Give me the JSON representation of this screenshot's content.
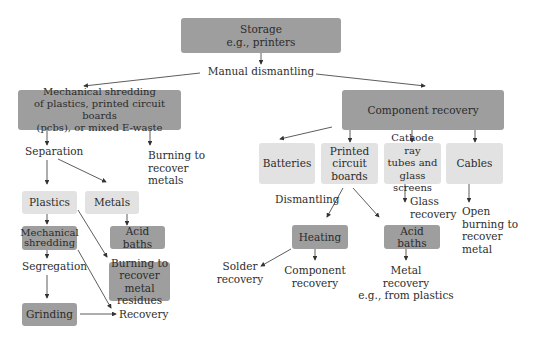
{
  "diagram": {
    "storage": {
      "line1": "Storage",
      "line2": "e.g., printers"
    },
    "manual_dismantling": "Manual dismantling",
    "mech_shredding_main": {
      "line1": "Mechanical shredding",
      "line2": "of plastics, printed circuit boards",
      "line3": "(pcbs), or mixed E-waste"
    },
    "separation": "Separation",
    "burning_recover_metals": {
      "line1": "Burning to",
      "line2": "recover",
      "line3": "metals"
    },
    "plastics": "Plastics",
    "metals": "Metals",
    "mech_shredding_sub": {
      "line1": "Mechanical",
      "line2": "shredding"
    },
    "acid_baths_left": "Acid baths",
    "segregation": "Segregation",
    "burning_residues": {
      "line1": "Burning to",
      "line2": "recover metal",
      "line3": "residues"
    },
    "grinding": "Grinding",
    "recovery": "Recovery",
    "component_recovery": "Component recovery",
    "batteries": "Batteries",
    "pcb": {
      "line1": "Printed",
      "line2": "circuit",
      "line3": "boards"
    },
    "crt": {
      "line1": "Cathode ray",
      "line2": "tubes and",
      "line3": "glass screens"
    },
    "cables": "Cables",
    "dismantling": "Dismantling",
    "glass_recovery": {
      "line1": "Glass",
      "line2": "recovery"
    },
    "open_burning": {
      "line1": "Open",
      "line2": "burning to",
      "line3": "recover",
      "line4": "metal"
    },
    "heating": "Heating",
    "acid_baths_right": "Acid baths",
    "solder_recovery": {
      "line1": "Solder",
      "line2": "recovery"
    },
    "component_recovery_sub": {
      "line1": "Component",
      "line2": "recovery"
    },
    "metal_recovery": {
      "line1": "Metal",
      "line2": "recovery",
      "line3": "e.g., from plastics"
    }
  },
  "colors": {
    "dark_box": "#9e9e9e",
    "light_box": "#e2e2e2",
    "arrow": "#333333"
  }
}
